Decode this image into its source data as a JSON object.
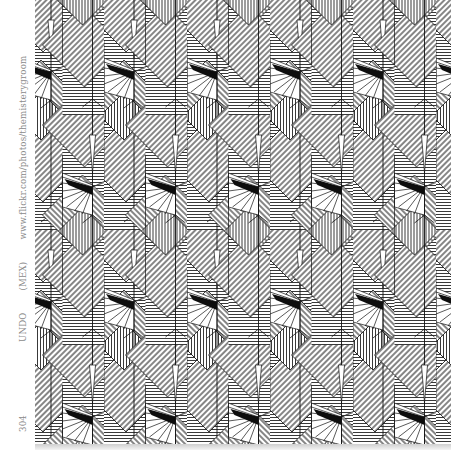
{
  "caption": {
    "number": "304",
    "title": "UNDO",
    "origin": "(MEX)",
    "url": "www.flickr.com/photos/themisterygroom"
  },
  "pattern": {
    "description": "black-and-white geometric hatched line pattern",
    "ink_color": "#111111",
    "paper_color": "#ffffff",
    "caption_color": "#8a8a8a",
    "tile_width": 83,
    "tile_height": 230
  }
}
